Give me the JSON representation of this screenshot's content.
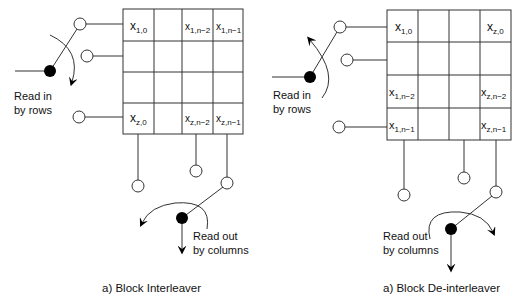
{
  "left": {
    "caption": "a) Block Interleaver",
    "input_label_1": "Read in",
    "input_label_2": "by rows",
    "output_label_1": "Read out",
    "output_label_2": "by columns",
    "cells": {
      "r0c0": {
        "base": "x",
        "sub": "1,0"
      },
      "r0c2": {
        "base": "x",
        "sub": "1,n−2"
      },
      "r0c3": {
        "base": "x",
        "sub": "1,n−1"
      },
      "r3c0": {
        "base": "x",
        "sub": "z,0"
      },
      "r3c2": {
        "base": "x",
        "sub": "z,n−2"
      },
      "r3c3": {
        "base": "x",
        "sub": "z,n−1"
      }
    }
  },
  "right": {
    "caption": "a) Block De-interleaver",
    "input_label_1": "Read in",
    "input_label_2": "by rows",
    "output_label_1": "Read out",
    "output_label_2": "by columns",
    "cells": {
      "r0c0": {
        "base": "x",
        "sub": "1,0"
      },
      "r0c3": {
        "base": "x",
        "sub": "z,0"
      },
      "r2c0": {
        "base": "x",
        "sub": "1,n−2"
      },
      "r2c3": {
        "base": "x",
        "sub": "z,n−2"
      },
      "r3c0": {
        "base": "x",
        "sub": "1,n−1"
      },
      "r3c3": {
        "base": "x",
        "sub": "z,n−1"
      }
    }
  }
}
